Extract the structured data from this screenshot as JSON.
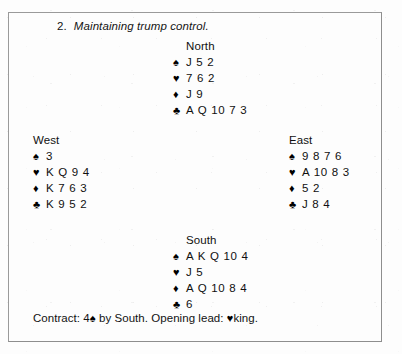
{
  "title": {
    "number": "2.",
    "text": "Maintaining trump control."
  },
  "suit_symbols": {
    "spade": "♠",
    "heart": "♥",
    "diamond": "♦",
    "club": "♣"
  },
  "hands": {
    "north": {
      "seat": "North",
      "spades": "J 5 2",
      "hearts": "7 6 2",
      "diamonds": "J 9",
      "clubs": "A Q 10 7 3"
    },
    "west": {
      "seat": "West",
      "spades": "3",
      "hearts": "K Q 9 4",
      "diamonds": "K 7 6 3",
      "clubs": "K 9 5 2"
    },
    "east": {
      "seat": "East",
      "spades": "9 8 7 6",
      "hearts": "A 10 8 3",
      "diamonds": "5 2",
      "clubs": "J 8 4"
    },
    "south": {
      "seat": "South",
      "spades": "A K Q 10 4",
      "hearts": "J 5",
      "diamonds": "A Q 10 8 4",
      "clubs": "6"
    }
  },
  "contract": {
    "label": "Contract:",
    "level": "4",
    "trump_suit": "♠",
    "declarer": "by South.",
    "lead_label": "Opening lead:",
    "lead_suit": "♥",
    "lead_card": "king."
  }
}
